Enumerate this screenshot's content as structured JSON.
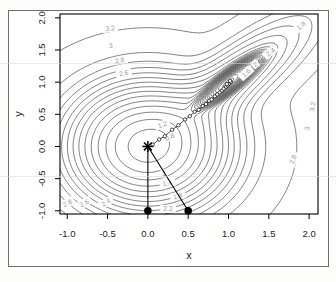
{
  "page": {
    "background": "#fdfdfc",
    "figure_border_color": "#6e6e6e"
  },
  "chart_data": {
    "type": "contour",
    "title": "",
    "xlabel": "x",
    "ylabel": "y",
    "xlim": [
      -1.09,
      2.11
    ],
    "ylim": [
      -1.05,
      2.06
    ],
    "xticks": {
      "values": [
        -1,
        -0.5,
        0,
        0.5,
        1,
        1.5,
        2
      ],
      "labels": [
        "-1.0",
        "-0.5",
        "0.0",
        "0.5",
        "1.0",
        "1.5",
        "2.0"
      ]
    },
    "yticks": {
      "values": [
        -1,
        -0.5,
        0,
        0.5,
        1,
        1.5,
        2
      ],
      "labels": [
        "-1.0",
        "-0.5",
        "0.0",
        "0.5",
        "1.0",
        "1.5",
        "2.0"
      ]
    },
    "grid": false,
    "contour_levels": {
      "min": -2.0,
      "step": 0.2,
      "count": 27
    },
    "surface": {
      "background_density": 0.04,
      "components": [
        {
          "cx": 0,
          "cy": 0,
          "sigma_u": 0.5,
          "sigma_v": 0.5,
          "rot_deg": 0,
          "amp": 0.7
        },
        {
          "cx": 1,
          "cy": 1,
          "sigma_u": 0.22,
          "sigma_v": 0.055,
          "rot_deg": 45,
          "amp": 8
        },
        {
          "cx": 1,
          "cy": 1,
          "sigma_u": 0.75,
          "sigma_v": 0.22,
          "rot_deg": 45,
          "amp": 0.12
        }
      ]
    },
    "contour_labels": [
      {
        "text": "3.2",
        "x": -0.47,
        "y": 1.84,
        "rot": -8
      },
      {
        "text": "3",
        "x": -0.46,
        "y": 1.57,
        "rot": -8
      },
      {
        "text": "2.8",
        "x": -0.35,
        "y": 1.34,
        "rot": -10
      },
      {
        "text": "2.6",
        "x": -0.3,
        "y": 1.14,
        "rot": -10
      },
      {
        "text": "1.8",
        "x": 1.9,
        "y": 1.88,
        "rot": -40
      },
      {
        "text": "2.4",
        "x": 1.52,
        "y": 1.47,
        "rot": -38
      },
      {
        "text": "2",
        "x": 1.33,
        "y": 1.28,
        "rot": -40
      },
      {
        "text": "1.6",
        "x": 1.22,
        "y": 1.14,
        "rot": -42
      },
      {
        "text": "1.2",
        "x": 0.18,
        "y": 0.34,
        "rot": -20
      },
      {
        "text": "0.8",
        "x": 0.27,
        "y": 0.15,
        "rot": -25
      },
      {
        "text": "1",
        "x": 0.2,
        "y": -0.42,
        "rot": 0
      },
      {
        "text": "1.4",
        "x": 0.24,
        "y": -0.57,
        "rot": -8
      },
      {
        "text": "1.8",
        "x": 0.37,
        "y": -0.77,
        "rot": -14
      },
      {
        "text": "2.2",
        "x": 0.25,
        "y": -0.97,
        "rot": 0
      },
      {
        "text": "2.8",
        "x": -1.0,
        "y": -0.88,
        "rot": -28
      },
      {
        "text": "2.6",
        "x": -0.79,
        "y": -0.88,
        "rot": -30
      },
      {
        "text": "2.4",
        "x": -0.52,
        "y": -0.87,
        "rot": -32
      },
      {
        "text": "2.8",
        "x": 1.8,
        "y": -0.2,
        "rot": -72
      },
      {
        "text": "3",
        "x": 1.97,
        "y": 0.28,
        "rot": -78
      },
      {
        "text": "3.2",
        "x": 2.04,
        "y": 0.62,
        "rot": -80
      }
    ],
    "minima": [
      {
        "x": 0,
        "y": 0,
        "marker": "asterisk"
      },
      {
        "x": 1,
        "y": 1,
        "marker": "dense-rings"
      }
    ],
    "start_points": [
      {
        "x": 0.0,
        "y": -1.0
      },
      {
        "x": 0.5,
        "y": -1.0
      }
    ],
    "connector_segments": [
      {
        "x1": 0.0,
        "y1": -1.0,
        "x2": 0.0,
        "y2": 0.0
      },
      {
        "x1": 0.5,
        "y1": -1.0,
        "x2": 0.0,
        "y2": 0.0
      }
    ],
    "iteration_path": [
      [
        0.06,
        0.03
      ],
      [
        0.14,
        0.11
      ],
      [
        0.21,
        0.16
      ],
      [
        0.3,
        0.26
      ],
      [
        0.38,
        0.33
      ],
      [
        0.46,
        0.42
      ],
      [
        0.52,
        0.47
      ],
      [
        0.58,
        0.54
      ],
      [
        0.63,
        0.57
      ],
      [
        0.68,
        0.63
      ],
      [
        0.72,
        0.66
      ],
      [
        0.76,
        0.71
      ],
      [
        0.79,
        0.73
      ],
      [
        0.83,
        0.78
      ],
      [
        0.86,
        0.81
      ],
      [
        0.89,
        0.84
      ],
      [
        0.92,
        0.87
      ],
      [
        0.94,
        0.9
      ],
      [
        0.97,
        0.93
      ],
      [
        0.99,
        0.95
      ],
      [
        1.01,
        0.98
      ],
      [
        1.03,
        1.0
      ],
      [
        0.98,
        0.97
      ],
      [
        1.02,
        1.02
      ]
    ],
    "colors": {
      "contour_line": "#3c3c3c",
      "contour_label": "#9b9b9b",
      "marker": "#000000",
      "axis_text": "#1c1c1c",
      "frame": "#000000"
    }
  }
}
